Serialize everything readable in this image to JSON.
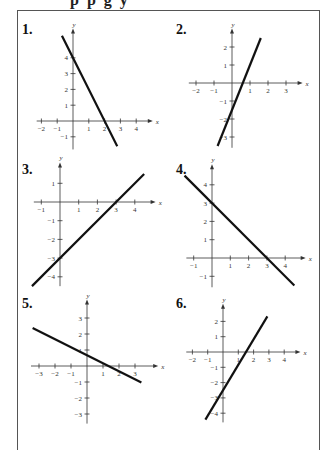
{
  "page": {
    "clipped_heading": "p p g y"
  },
  "chart_data": [
    {
      "id": 1,
      "label": "1.",
      "type": "line",
      "xlabel": "x",
      "ylabel": "y",
      "xticks": [
        -2,
        -1,
        1,
        2,
        3,
        4
      ],
      "yticks": [
        -1,
        1,
        2,
        3,
        4
      ],
      "xlim": [
        -2.3,
        4.8
      ],
      "ylim": [
        -1.8,
        5.6
      ],
      "line": {
        "x1": -0.7,
        "y1": 5.4,
        "x2": 2.8,
        "y2": -1.6,
        "slope": -2,
        "intercept": 4
      },
      "grid": false
    },
    {
      "id": 2,
      "label": "2.",
      "type": "line",
      "xlabel": "x",
      "ylabel": "y",
      "xticks": [
        -2,
        -1,
        1,
        2,
        3
      ],
      "yticks": [
        -3,
        -2,
        -1,
        1,
        2
      ],
      "xlim": [
        -2.4,
        3.7
      ],
      "ylim": [
        -3.6,
        2.8
      ],
      "line": {
        "x1": -0.8,
        "y1": -3.5,
        "x2": 1.6,
        "y2": 2.5,
        "slope": 2.5,
        "intercept": -1.5
      },
      "grid": false
    },
    {
      "id": 3,
      "label": "3.",
      "type": "line",
      "xlabel": "x",
      "ylabel": "y",
      "xticks": [
        -1,
        1,
        2,
        3,
        4
      ],
      "yticks": [
        -4,
        -3,
        -2,
        -1,
        1
      ],
      "xlim": [
        -1.4,
        4.9
      ],
      "ylim": [
        -4.5,
        1.9
      ],
      "line": {
        "x1": -1.5,
        "y1": -4.5,
        "x2": 4.5,
        "y2": 1.5,
        "slope": 1,
        "intercept": -3
      },
      "grid": false
    },
    {
      "id": 4,
      "label": "4.",
      "type": "line",
      "xlabel": "x",
      "ylabel": "y",
      "xticks": [
        -1,
        1,
        2,
        3,
        4
      ],
      "yticks": [
        -1,
        1,
        2,
        3,
        4
      ],
      "xlim": [
        -1.4,
        4.9
      ],
      "ylim": [
        -1.6,
        4.9
      ],
      "line": {
        "x1": -1.5,
        "y1": 4.5,
        "x2": 4.5,
        "y2": -1.5,
        "slope": -1,
        "intercept": 3
      },
      "grid": false
    },
    {
      "id": 5,
      "label": "5.",
      "type": "line",
      "xlabel": "x",
      "ylabel": "y",
      "xticks": [
        -3,
        -2,
        -1,
        1,
        2,
        3
      ],
      "yticks": [
        -3,
        -2,
        -1,
        1,
        2,
        3
      ],
      "xlim": [
        -3.5,
        4.2
      ],
      "ylim": [
        -3.6,
        3.9
      ],
      "line": {
        "x1": -3.4,
        "y1": 2.37,
        "x2": 3.4,
        "y2": -1.03,
        "slope": -0.5,
        "intercept": 0.67
      },
      "grid": false
    },
    {
      "id": 6,
      "label": "6.",
      "type": "line",
      "xlabel": "x",
      "ylabel": "y",
      "xticks": [
        -2,
        -1,
        1,
        2,
        3,
        4
      ],
      "yticks": [
        -4,
        -3,
        -2,
        -1,
        1,
        2
      ],
      "xlim": [
        -2.4,
        4.8
      ],
      "ylim": [
        -4.6,
        2.9
      ],
      "line": {
        "x1": -1.15,
        "y1": -4.42,
        "x2": 2.9,
        "y2": 2.33,
        "slope": 1.667,
        "intercept": -2.5
      },
      "grid": false
    }
  ],
  "layout": [
    {
      "num_x": 22,
      "num_y": 22,
      "ox": 73,
      "oy": 121,
      "unit": 15.8
    },
    {
      "num_x": 176,
      "num_y": 22,
      "ox": 232,
      "oy": 83,
      "unit": 18.0
    },
    {
      "num_x": 22,
      "num_y": 162,
      "ox": 60,
      "oy": 202,
      "unit": 18.7
    },
    {
      "num_x": 176,
      "num_y": 162,
      "ox": 212,
      "oy": 258,
      "unit": 18.3
    },
    {
      "num_x": 22,
      "num_y": 296,
      "ox": 87,
      "oy": 366,
      "unit": 16.0
    },
    {
      "num_x": 176,
      "num_y": 296,
      "ox": 223,
      "oy": 352,
      "unit": 15.3
    }
  ]
}
